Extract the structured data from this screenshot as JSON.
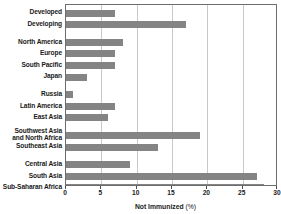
{
  "chart_data": {
    "type": "bar",
    "orientation": "horizontal",
    "title": "",
    "xlabel": "Not Immunized (%)",
    "ylabel": "",
    "xlim": [
      0,
      30
    ],
    "xticks": [
      0,
      5,
      10,
      15,
      20,
      25,
      30
    ],
    "grid": true,
    "legend": null,
    "bar_color": "#848484",
    "categories": [
      "Developed",
      "Developing",
      "North America",
      "Europe",
      "South Pacific",
      "Japan",
      "Russia",
      "Latin America",
      "East Asia",
      "Southwest Asia and North Africa",
      "Southeast Asia",
      "Central Asia",
      "South Asia",
      "Sub-Saharan Africa"
    ],
    "values": [
      7,
      17,
      8,
      7,
      7,
      3,
      1,
      7,
      6,
      19,
      13,
      9,
      27,
      28
    ],
    "rows": [
      {
        "label": "Developed",
        "label_lines": [
          "Developed"
        ],
        "value": 7,
        "group": 0
      },
      {
        "label": "Developing",
        "label_lines": [
          "Developing"
        ],
        "value": 17,
        "group": 0
      },
      {
        "label": "North America",
        "label_lines": [
          "North America"
        ],
        "value": 8,
        "group": 1
      },
      {
        "label": "Europe",
        "label_lines": [
          "Europe"
        ],
        "value": 7,
        "group": 1
      },
      {
        "label": "South Pacific",
        "label_lines": [
          "South Pacific"
        ],
        "value": 7,
        "group": 1
      },
      {
        "label": "Japan",
        "label_lines": [
          "Japan"
        ],
        "value": 3,
        "group": 1
      },
      {
        "label": "Russia",
        "label_lines": [
          "Russia"
        ],
        "value": 1,
        "group": 2
      },
      {
        "label": "Latin America",
        "label_lines": [
          "Latin America"
        ],
        "value": 7,
        "group": 2
      },
      {
        "label": "East Asia",
        "label_lines": [
          "East Asia"
        ],
        "value": 6,
        "group": 2
      },
      {
        "label": "Southwest Asia and North Africa",
        "label_lines": [
          "Southwest Asia",
          "and North Africa"
        ],
        "value": 19,
        "group": 3
      },
      {
        "label": "Southeast Asia",
        "label_lines": [
          "Southeast Asia"
        ],
        "value": 13,
        "group": 3
      },
      {
        "label": "Central Asia",
        "label_lines": [
          "Central Asia"
        ],
        "value": 9,
        "group": 4
      },
      {
        "label": "South Asia",
        "label_lines": [
          "South Asia"
        ],
        "value": 27,
        "group": 4
      },
      {
        "label": "Sub-Saharan Africa",
        "label_lines": [
          "Sub-Saharan Africa"
        ],
        "value": 28,
        "group": 4
      }
    ]
  },
  "axis": {
    "title_main": "Not Immunized",
    "title_unit": "(%)",
    "tick_labels": [
      "0",
      "5",
      "10",
      "15",
      "20",
      "25",
      "30"
    ]
  }
}
